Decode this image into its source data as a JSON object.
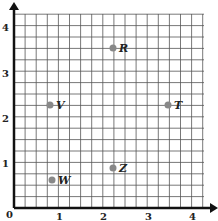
{
  "chart_data": {
    "type": "scatter",
    "title": "",
    "xlabel": "",
    "ylabel": "",
    "xlim": [
      0,
      4.4
    ],
    "ylim": [
      0,
      4.4
    ],
    "grid": true,
    "grid_step": 0.25,
    "x_ticks": [
      "0",
      "1",
      "2",
      "3",
      "4"
    ],
    "y_ticks": [
      "1",
      "2",
      "3",
      "4"
    ],
    "points": [
      {
        "label": "R",
        "x": 2.25,
        "y": 3.6
      },
      {
        "label": "V",
        "x": 0.8,
        "y": 2.3
      },
      {
        "label": "T",
        "x": 3.5,
        "y": 2.3
      },
      {
        "label": "Z",
        "x": 2.25,
        "y": 0.9
      },
      {
        "label": "W",
        "x": 0.8,
        "y": 0.6
      }
    ],
    "colors": {
      "point": "#888888",
      "grid": "#555555",
      "axis": "#111111"
    }
  },
  "labels": {
    "origin": "0",
    "x1": "1",
    "x2": "2",
    "x3": "3",
    "x4": "4",
    "y1": "1",
    "y2": "2",
    "y3": "3",
    "y4": "4",
    "R": "R",
    "V": "V",
    "T": "T",
    "Z": "Z",
    "W": "W"
  }
}
